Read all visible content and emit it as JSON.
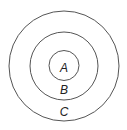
{
  "diagram": {
    "type": "concentric-circles",
    "stroke_color": "#555555",
    "labels": {
      "inner": "A",
      "middle": "B",
      "outer": "C"
    }
  }
}
